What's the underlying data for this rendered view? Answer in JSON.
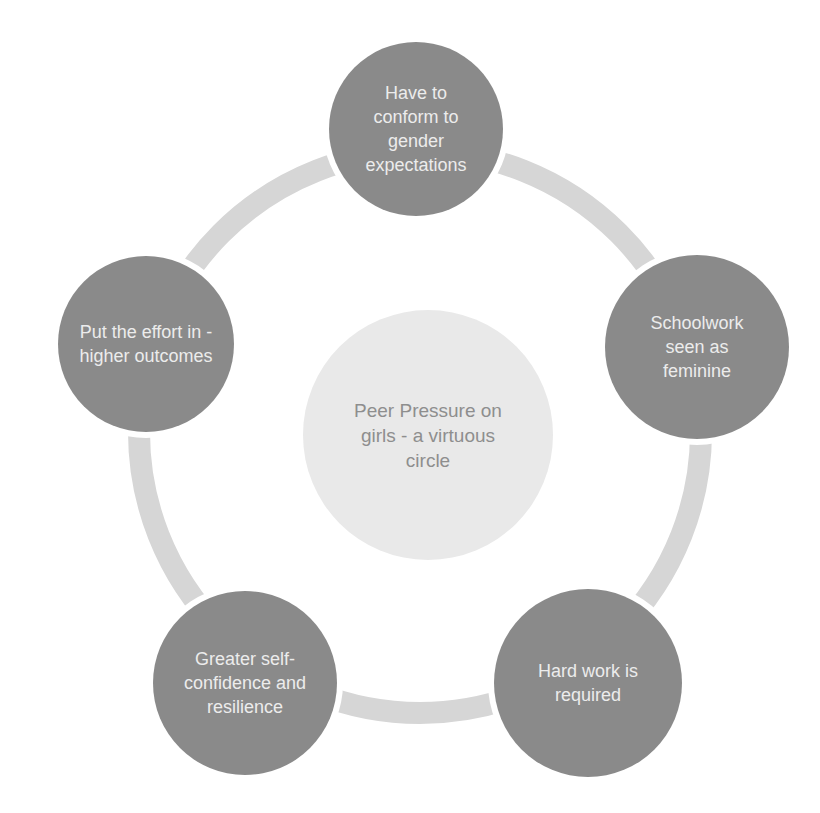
{
  "diagram": {
    "type": "cycle",
    "center": {
      "label": "Peer Pressure on girls - a virtuous circle",
      "x": 428,
      "y": 435,
      "r": 125,
      "fill": "#e9e9e9",
      "text_color": "#8e8e8e"
    },
    "ring": {
      "color": "#d6d6d6",
      "cx": 420,
      "cy": 432,
      "r": 292,
      "thickness": 22
    },
    "nodes": [
      {
        "label": "Have to conform to gender expectations",
        "x": 416,
        "y": 129,
        "r": 87
      },
      {
        "label": "Schoolwork seen as feminine",
        "x": 697,
        "y": 347,
        "r": 92
      },
      {
        "label": "Hard work is required",
        "x": 588,
        "y": 683,
        "r": 94
      },
      {
        "label": "Greater self-confidence and resilience",
        "x": 245,
        "y": 683,
        "r": 92
      },
      {
        "label": "Put the effort in - higher outcomes",
        "x": 146,
        "y": 344,
        "r": 88
      }
    ],
    "node_fill": "#8a8a8a",
    "node_text_color": "#ececec"
  }
}
